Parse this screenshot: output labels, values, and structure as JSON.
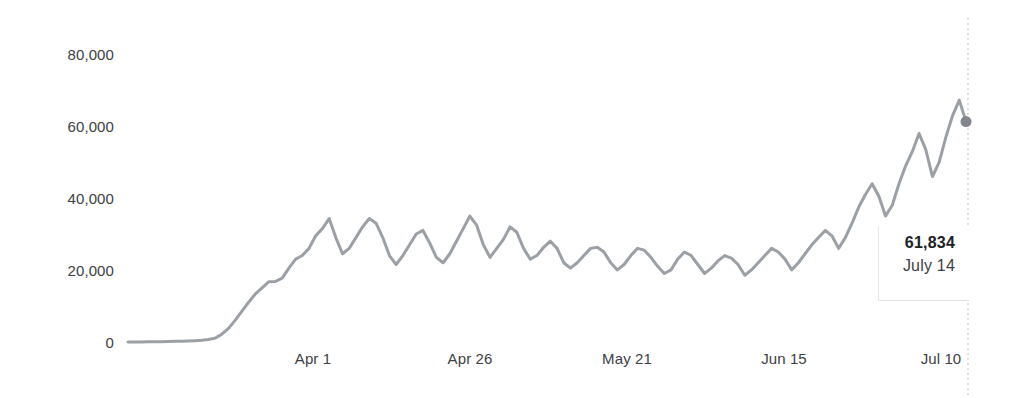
{
  "chart_data": {
    "type": "line",
    "title": "",
    "subtitle": "",
    "xlabel": "",
    "ylabel": "",
    "grid": false,
    "legend": "none",
    "legend_entries": [],
    "line_color": "#9aa0a6",
    "marker_color": "#80868b",
    "axis_text_color": "#3c4043",
    "cursor_line_color": "#cccccc",
    "ylim": [
      0,
      88000
    ],
    "y_ticks": [
      0,
      20000,
      40000,
      60000,
      80000
    ],
    "y_tick_labels": [
      "0",
      "20,000",
      "40,000",
      "60,000",
      "80,000"
    ],
    "x_ticks": [
      "Apr 1",
      "Apr 26",
      "May 21",
      "Jun 15",
      "Jul 10"
    ],
    "x_tick_labels": [
      "Apr 1",
      "Apr 26",
      "May 21",
      "Jun 15",
      "Jul 10"
    ],
    "x_start": "Mar 11",
    "x_end": "July 14",
    "highlight": {
      "x": "July 14",
      "value": 61834,
      "value_label": "61,834",
      "date_label": "July 14"
    },
    "x": [
      "Mar 11",
      "Mar 12",
      "Mar 13",
      "Mar 14",
      "Mar 15",
      "Mar 16",
      "Mar 17",
      "Mar 18",
      "Mar 19",
      "Mar 20",
      "Mar 21",
      "Mar 22",
      "Mar 23",
      "Mar 24",
      "Mar 25",
      "Mar 26",
      "Mar 27",
      "Mar 28",
      "Mar 29",
      "Mar 30",
      "Mar 31",
      "Apr 1",
      "Apr 2",
      "Apr 3",
      "Apr 4",
      "Apr 5",
      "Apr 6",
      "Apr 7",
      "Apr 8",
      "Apr 9",
      "Apr 10",
      "Apr 11",
      "Apr 12",
      "Apr 13",
      "Apr 14",
      "Apr 15",
      "Apr 16",
      "Apr 17",
      "Apr 18",
      "Apr 19",
      "Apr 20",
      "Apr 21",
      "Apr 22",
      "Apr 23",
      "Apr 24",
      "Apr 25",
      "Apr 26",
      "Apr 27",
      "Apr 28",
      "Apr 29",
      "Apr 30",
      "May 1",
      "May 2",
      "May 3",
      "May 4",
      "May 5",
      "May 6",
      "May 7",
      "May 8",
      "May 9",
      "May 10",
      "May 11",
      "May 12",
      "May 13",
      "May 14",
      "May 15",
      "May 16",
      "May 17",
      "May 18",
      "May 19",
      "May 20",
      "May 21",
      "May 22",
      "May 23",
      "May 24",
      "May 25",
      "May 26",
      "May 27",
      "May 28",
      "May 29",
      "May 30",
      "May 31",
      "Jun 1",
      "Jun 2",
      "Jun 3",
      "Jun 4",
      "Jun 5",
      "Jun 6",
      "Jun 7",
      "Jun 8",
      "Jun 9",
      "Jun 10",
      "Jun 11",
      "Jun 12",
      "Jun 13",
      "Jun 14",
      "Jun 15",
      "Jun 16",
      "Jun 17",
      "Jun 18",
      "Jun 19",
      "Jun 20",
      "Jun 21",
      "Jun 22",
      "Jun 23",
      "Jun 24",
      "Jun 25",
      "Jun 26",
      "Jun 27",
      "Jun 28",
      "Jun 29",
      "Jun 30",
      "Jul 1",
      "Jul 2",
      "Jul 3",
      "Jul 4",
      "Jul 5",
      "Jul 6",
      "Jul 7",
      "Jul 8",
      "Jul 9",
      "Jul 10",
      "Jul 11",
      "Jul 12",
      "Jul 13",
      "Jul 14"
    ],
    "values": [
      420,
      430,
      450,
      470,
      500,
      520,
      560,
      600,
      650,
      700,
      780,
      900,
      1100,
      1500,
      2600,
      4200,
      6500,
      9000,
      11500,
      13800,
      15500,
      17200,
      17300,
      18200,
      21000,
      23500,
      24500,
      26500,
      30000,
      32000,
      34800,
      29500,
      25000,
      26500,
      29500,
      32500,
      34800,
      33500,
      29500,
      24500,
      22000,
      24500,
      27500,
      30500,
      31500,
      28000,
      24000,
      22500,
      25000,
      28500,
      32000,
      35500,
      33000,
      27500,
      24000,
      26500,
      29000,
      32500,
      31000,
      26500,
      23500,
      24500,
      26800,
      28500,
      26500,
      22500,
      21000,
      22500,
      24500,
      26500,
      26800,
      25500,
      22500,
      20500,
      22000,
      24500,
      26500,
      26000,
      24000,
      21500,
      19500,
      20500,
      23500,
      25500,
      24500,
      22000,
      19500,
      21000,
      23000,
      24500,
      23800,
      22000,
      19000,
      20500,
      22500,
      24500,
      26500,
      25500,
      23500,
      20500,
      22500,
      25000,
      27500,
      29500,
      31500,
      30000,
      26500,
      29500,
      33500,
      38000,
      41500,
      44500,
      41000,
      35500,
      38500,
      44500,
      49500,
      53500,
      58500,
      54000,
      46500,
      50500,
      57500,
      63500,
      67800,
      61834
    ]
  }
}
